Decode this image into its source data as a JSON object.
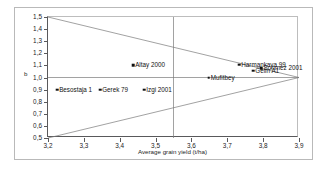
{
  "chart_data": {
    "type": "scatter",
    "title": "",
    "xlabel": "Average grain yield (t/ha)",
    "ylabel": "b",
    "xlim": [
      3.2,
      3.9
    ],
    "ylim": [
      0.5,
      1.5
    ],
    "xticks": [
      "3,2",
      "3,3",
      "3,4",
      "3,5",
      "3,6",
      "3,7",
      "3,8",
      "3,9"
    ],
    "xtick_values": [
      3.2,
      3.3,
      3.4,
      3.5,
      3.6,
      3.7,
      3.8,
      3.9
    ],
    "yticks": [
      "0,5",
      "0,6",
      "0,7",
      "0,8",
      "0,9",
      "1,0",
      "1,1",
      "1,2",
      "1,3",
      "1,4",
      "1,5"
    ],
    "ytick_values": [
      0.5,
      0.6,
      0.7,
      0.8,
      0.9,
      1.0,
      1.1,
      1.2,
      1.3,
      1.4,
      1.5
    ],
    "grid": false,
    "legend": "none",
    "points": [
      {
        "label": "Besostaja 1",
        "x": 3.225,
        "y": 0.9,
        "label_side": "right"
      },
      {
        "label": "Gerek 79",
        "x": 3.345,
        "y": 0.9,
        "label_side": "right"
      },
      {
        "label": "Izgi 2001",
        "x": 3.468,
        "y": 0.9,
        "label_side": "right"
      },
      {
        "label": "Altay 2000",
        "x": 3.437,
        "y": 1.1,
        "label_side": "right"
      },
      {
        "label": "Mufitbey",
        "x": 3.648,
        "y": 1.0,
        "label_side": "right"
      },
      {
        "label": "Harmankaya 99",
        "x": 3.733,
        "y": 1.105,
        "label_side": "right"
      },
      {
        "label": "Sonmez 2001",
        "x": 3.795,
        "y": 1.075,
        "label_side": "right"
      },
      {
        "label": "Gelin A1",
        "x": 3.772,
        "y": 1.055,
        "label_side": "right"
      }
    ],
    "reference_lines": [
      {
        "name": "horizontal-b-equals-one",
        "type": "horizontal",
        "y": 1.0
      },
      {
        "name": "vertical-mean-yield",
        "type": "vertical",
        "x": 3.55
      },
      {
        "name": "upper-convergence-line",
        "type": "segment",
        "x1": 3.2,
        "y1": 1.5,
        "x2": 3.9,
        "y2": 1.0
      },
      {
        "name": "lower-convergence-line",
        "type": "segment",
        "x1": 3.2,
        "y1": 0.5,
        "x2": 3.9,
        "y2": 1.0
      }
    ],
    "colors": {
      "marker": "#111111",
      "axis": "#59595b",
      "reference_line": "#7a7a7a",
      "frame": "#b9b9b9",
      "background": "#ffffff"
    }
  }
}
